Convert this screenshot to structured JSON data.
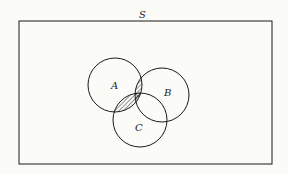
{
  "diagram": {
    "type": "venn",
    "universe_label": "S",
    "sets": [
      {
        "label": "A"
      },
      {
        "label": "B"
      },
      {
        "label": "C"
      }
    ],
    "shaded_regions": [
      {
        "region": "A∩B",
        "style": "hatched"
      },
      {
        "region": "A∩C",
        "style": "hatched"
      },
      {
        "region": "A∩B∩C",
        "style": "cross-hatched"
      }
    ],
    "colors": {
      "stroke": "#1a1a1a",
      "background": "#fbfbf8"
    }
  }
}
